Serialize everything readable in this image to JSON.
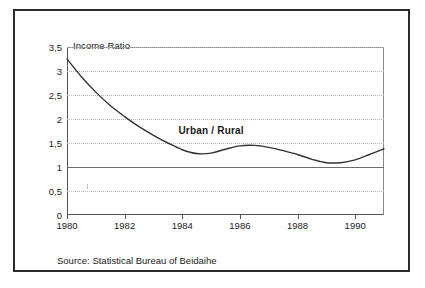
{
  "chart_data": {
    "type": "line",
    "title": "",
    "ylabel": "Income Ratio",
    "xlabel": "",
    "xlim": [
      1980,
      1991
    ],
    "ylim": [
      0,
      3.5
    ],
    "grid": true,
    "legend_position": "inline-annotation",
    "y_ticks": [
      "0",
      "0,5",
      "1",
      "1,5",
      "2",
      "2,5",
      "3",
      "3,5"
    ],
    "y_tick_values": [
      0,
      0.5,
      1,
      1.5,
      2,
      2.5,
      3,
      3.5
    ],
    "x_ticks": [
      "1980",
      "1982",
      "1984",
      "1986",
      "1988",
      "1990"
    ],
    "x_tick_values": [
      1980,
      1982,
      1984,
      1986,
      1988,
      1990
    ],
    "reference_line": {
      "value": 1,
      "style": "solid"
    },
    "annotations": [
      {
        "text": "Urban / Rural",
        "x": 1985.0,
        "y": 1.78,
        "bold": true
      }
    ],
    "series": [
      {
        "name": "Urban / Rural",
        "color": "#333333",
        "x": [
          1980,
          1980.5,
          1981,
          1981.5,
          1982,
          1982.5,
          1983,
          1983.5,
          1984,
          1984.5,
          1985,
          1985.5,
          1986,
          1986.5,
          1987,
          1987.5,
          1988,
          1988.5,
          1989,
          1989.5,
          1990,
          1990.5,
          1991
        ],
        "values": [
          3.25,
          2.88,
          2.56,
          2.28,
          2.05,
          1.84,
          1.66,
          1.5,
          1.36,
          1.28,
          1.29,
          1.37,
          1.44,
          1.45,
          1.41,
          1.34,
          1.26,
          1.16,
          1.09,
          1.09,
          1.15,
          1.26,
          1.38
        ]
      }
    ],
    "source": "Source: Statistical Bureau of Beidaihe"
  },
  "figure": {
    "axis_title": "Income Ratio",
    "series_label": "Urban / Rural",
    "source": "Source: Statistical Bureau of Beidaihe"
  }
}
